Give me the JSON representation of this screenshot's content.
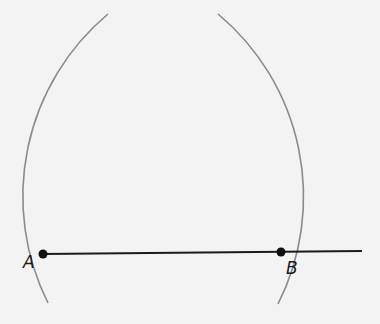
{
  "diagram": {
    "type": "geometric-construction",
    "points": [
      {
        "label": "A",
        "x": 43,
        "y": 254
      },
      {
        "label": "B",
        "x": 281,
        "y": 252
      }
    ],
    "segment": {
      "from": "A",
      "to": "B",
      "extends_to_x": 362
    },
    "arcs": [
      {
        "center": "A",
        "through": "B",
        "color": "#8a8a8a"
      },
      {
        "center": "B",
        "through": "A",
        "color": "#8a8a8a"
      }
    ],
    "colors": {
      "line": "#1a1a1a",
      "arc": "#8a8a8a",
      "point": "#111111",
      "background": "#f3f3f3"
    }
  }
}
